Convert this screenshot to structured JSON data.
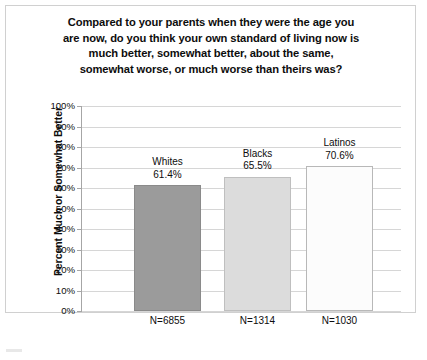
{
  "chart_data": {
    "type": "bar",
    "title_lines": [
      "Compared to your parents when they were the age you",
      "are now, do you think your own standard of living now is",
      "much better, somewhat better, about the same,",
      "somewhat worse, or much worse than theirs was?"
    ],
    "xlabel": "",
    "ylabel": "Percent Much or Somewhat Better",
    "ylim": [
      0,
      100
    ],
    "ytick_labels": [
      "100%",
      "90%",
      "80%",
      "70%",
      "60%",
      "50%",
      "40%",
      "30%",
      "20%",
      "10%",
      "0%"
    ],
    "ytick_values": [
      100,
      90,
      80,
      70,
      60,
      50,
      40,
      30,
      20,
      10,
      0
    ],
    "grid": true,
    "legend": "none",
    "categories": [
      "Whites",
      "Blacks",
      "Latinos"
    ],
    "values": [
      61.4,
      65.5,
      70.6
    ],
    "value_labels": [
      "61.4%",
      "65.5%",
      "70.6%"
    ],
    "sample_sizes": [
      "N=6855",
      "N=1314",
      "N=1030"
    ],
    "bars": [
      {
        "category": "Whites",
        "value": 61.4,
        "value_label": "61.4%",
        "n_label": "N=6855",
        "fill": "#9b9b9b",
        "border": "#8a8a8a"
      },
      {
        "category": "Blacks",
        "value": 65.5,
        "value_label": "65.5%",
        "n_label": "N=1314",
        "fill": "#dcdcdc",
        "border": "#bfbfbf"
      },
      {
        "category": "Latinos",
        "value": 70.6,
        "value_label": "70.6%",
        "n_label": "N=1030",
        "fill": "#fcfcfc",
        "border": "#b8b8b8"
      }
    ],
    "colors": {
      "gridline": "#d6d6d6",
      "axis": "#a6a6a6",
      "frame": "#d0d0d0",
      "text": "#0d0d0d",
      "background": "#ffffff"
    }
  }
}
